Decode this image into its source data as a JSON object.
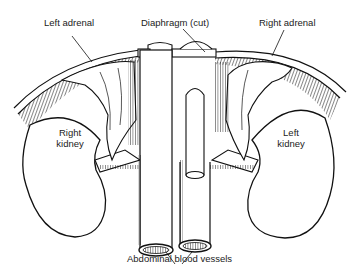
{
  "diagram": {
    "type": "anatomical-illustration",
    "colors": {
      "ink": "#111111",
      "background": "#ffffff",
      "label": "#222222"
    },
    "labels": {
      "left_adrenal": "Left adrenal",
      "diaphragm": "Diaphragm (cut)",
      "right_adrenal": "Right adrenal",
      "right_kidney_line1": "Right",
      "right_kidney_line2": "kidney",
      "left_kidney_line1": "Left",
      "left_kidney_line2": "kidney",
      "vessels": "Abdominal blood vessels"
    }
  }
}
